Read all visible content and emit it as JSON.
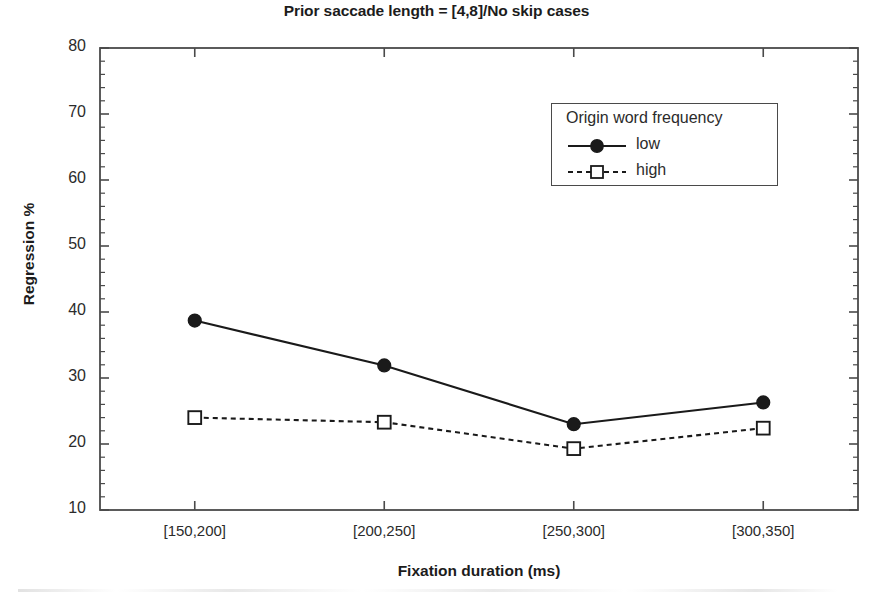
{
  "chart_data": {
    "type": "line",
    "title": "Prior saccade length = [4,8]/No skip cases",
    "xlabel": "Fixation duration (ms)",
    "ylabel": "Regression %",
    "categories": [
      "[150,200]",
      "[200,250]",
      "[250,300]",
      "[300,350]"
    ],
    "series": [
      {
        "name": "low",
        "values": [
          38.7,
          31.9,
          23.0,
          26.3
        ],
        "marker": "filled-circle",
        "linestyle": "solid",
        "color": "#1a1a1a"
      },
      {
        "name": "high",
        "values": [
          24.0,
          23.3,
          19.3,
          22.4
        ],
        "marker": "open-square",
        "linestyle": "dashed",
        "color": "#1a1a1a"
      }
    ],
    "ylim": [
      10,
      80
    ],
    "ytick_labels": [
      "10",
      "20",
      "30",
      "40",
      "50",
      "60",
      "70",
      "80"
    ],
    "ytick_values": [
      10,
      20,
      30,
      40,
      50,
      60,
      70,
      80
    ],
    "yminor_step": 2,
    "grid": false,
    "legend_title": "Origin word frequency",
    "legend_position": "upper-right-inside",
    "axis_frame": true
  },
  "colors": {
    "background": "#ffffff",
    "axis": "#4a4a4a",
    "text": "#1c1c1c",
    "series": "#1a1a1a"
  }
}
